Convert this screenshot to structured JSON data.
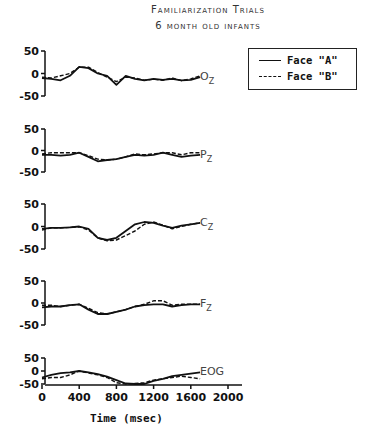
{
  "header": {
    "title": "Familiarization Trials",
    "subtitle": "6 month old infants"
  },
  "legend": {
    "items": [
      {
        "label": "Face \"A\"",
        "style": "solid"
      },
      {
        "label": "Face \"B\"",
        "style": "dashed"
      }
    ]
  },
  "xaxis": {
    "label": "Time (msec)",
    "ticks": [
      "0",
      "400",
      "800",
      "1200",
      "1600",
      "2000"
    ]
  },
  "chart_data": {
    "type": "line",
    "xlabel": "Time (msec)",
    "ylabel": "",
    "xlim": [
      0,
      2000
    ],
    "x_ticks": [
      0,
      400,
      800,
      1200,
      1600,
      2000
    ],
    "legend_position": "top-right",
    "grid": false,
    "x": [
      0,
      100,
      200,
      300,
      400,
      500,
      600,
      700,
      800,
      900,
      1000,
      1100,
      1200,
      1300,
      1400,
      1500,
      1600,
      1700
    ],
    "panels": [
      {
        "channel": "Oz",
        "ylim": [
          -50,
          50
        ],
        "y_ticks": [
          50,
          0,
          -50
        ],
        "series": [
          {
            "name": "Face \"A\"",
            "values": [
              -10,
              -12,
              -15,
              -5,
              15,
              12,
              0,
              -5,
              -25,
              -5,
              -12,
              -15,
              -12,
              -14,
              -12,
              -15,
              -14,
              -8
            ]
          },
          {
            "name": "Face \"B\"",
            "values": [
              -8,
              -10,
              -5,
              0,
              14,
              14,
              2,
              -8,
              -18,
              -8,
              -10,
              -15,
              -13,
              -15,
              -10,
              -16,
              -12,
              -5
            ]
          }
        ]
      },
      {
        "channel": "Pz",
        "ylim": [
          -50,
          50
        ],
        "y_ticks": [
          50,
          0,
          -50
        ],
        "series": [
          {
            "name": "Face \"A\"",
            "values": [
              -10,
              -10,
              -12,
              -10,
              -5,
              -15,
              -25,
              -22,
              -20,
              -15,
              -10,
              -12,
              -10,
              -5,
              -10,
              -15,
              -12,
              -10
            ]
          },
          {
            "name": "Face \"B\"",
            "values": [
              -8,
              -5,
              -5,
              -5,
              -5,
              -12,
              -20,
              -22,
              -20,
              -15,
              -8,
              -10,
              -8,
              -5,
              -5,
              -10,
              -5,
              -5
            ]
          }
        ]
      },
      {
        "channel": "Cz",
        "ylim": [
          -50,
          50
        ],
        "y_ticks": [
          50,
          0,
          -50
        ],
        "series": [
          {
            "name": "Face \"A\"",
            "values": [
              -5,
              -3,
              -3,
              -2,
              0,
              -5,
              -25,
              -30,
              -25,
              -10,
              5,
              10,
              8,
              2,
              -3,
              2,
              5,
              8
            ]
          },
          {
            "name": "Face \"B\"",
            "values": [
              -8,
              -3,
              -3,
              -2,
              -1,
              -8,
              -25,
              -32,
              -30,
              -20,
              -10,
              5,
              10,
              3,
              -5,
              0,
              5,
              8
            ]
          }
        ]
      },
      {
        "channel": "Fz",
        "ylim": [
          -50,
          50
        ],
        "y_ticks": [
          50,
          0,
          -50
        ],
        "series": [
          {
            "name": "Face \"A\"",
            "values": [
              -10,
              -8,
              -8,
              -5,
              -3,
              -15,
              -25,
              -25,
              -20,
              -15,
              -8,
              -5,
              -3,
              -3,
              -8,
              -5,
              -3,
              -3
            ]
          },
          {
            "name": "Face \"B\"",
            "values": [
              -5,
              -5,
              -8,
              -5,
              -3,
              -12,
              -22,
              -25,
              -20,
              -15,
              -8,
              -3,
              5,
              5,
              -5,
              -3,
              -3,
              -3
            ]
          }
        ]
      },
      {
        "channel": "EOG",
        "ylim": [
          -50,
          50
        ],
        "y_ticks": [
          50,
          0,
          -50
        ],
        "series": [
          {
            "name": "Face \"A\"",
            "values": [
              -25,
              -15,
              -8,
              -5,
              0,
              -5,
              -12,
              -22,
              -35,
              -48,
              -50,
              -50,
              -38,
              -30,
              -20,
              -15,
              -10,
              -5
            ]
          },
          {
            "name": "Face \"B\"",
            "values": [
              -30,
              -25,
              -25,
              -15,
              0,
              -8,
              -15,
              -25,
              -45,
              -50,
              -48,
              -45,
              -35,
              -30,
              -25,
              -20,
              -25,
              -30
            ]
          }
        ]
      }
    ]
  }
}
